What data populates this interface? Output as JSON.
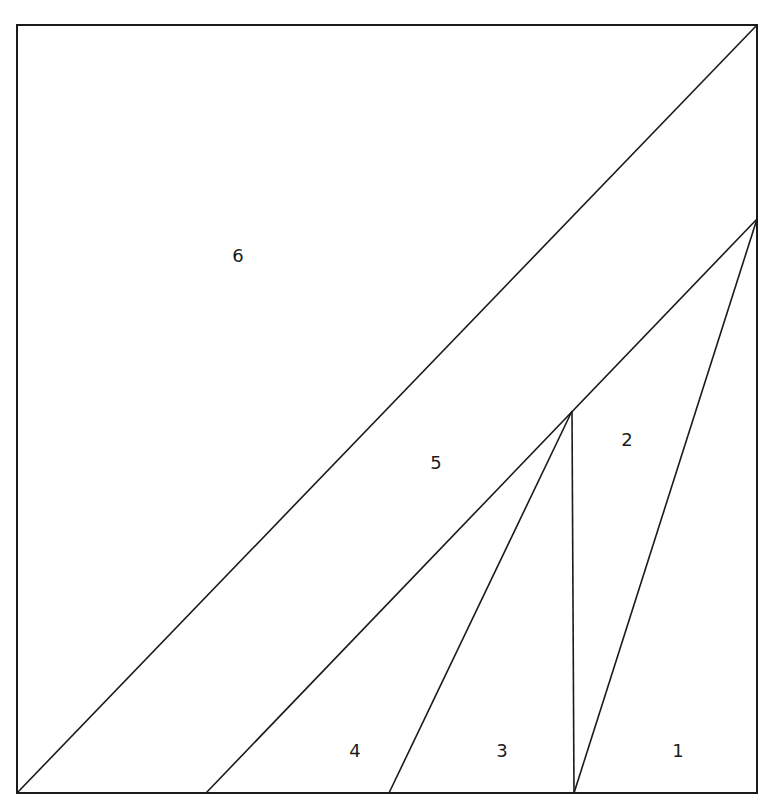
{
  "diagram": {
    "type": "square dissection into six regions",
    "stroke_color": "#1a1a1a",
    "background": "#ffffff",
    "square": {
      "x": 17,
      "y": 25,
      "width": 740,
      "height": 768
    },
    "points": {
      "top_right": [
        757,
        25
      ],
      "right_mid": [
        757,
        219
      ],
      "inner": [
        572,
        411
      ],
      "bottom_left": [
        17,
        793
      ],
      "bottom_a": [
        206,
        793
      ],
      "bottom_b": [
        389,
        793
      ],
      "bottom_c": [
        574,
        793
      ],
      "bottom_right": [
        757,
        793
      ]
    },
    "segments": [
      {
        "from": [
          17,
          793
        ],
        "to": [
          757,
          25
        ]
      },
      {
        "from": [
          206,
          793
        ],
        "to": [
          757,
          219
        ]
      },
      {
        "from": [
          389,
          793
        ],
        "to": [
          572,
          411
        ]
      },
      {
        "from": [
          574,
          793
        ],
        "to": [
          572,
          411
        ]
      },
      {
        "from": [
          574,
          793
        ],
        "to": [
          757,
          219
        ]
      }
    ],
    "regions": [
      {
        "label": "1",
        "x": 678,
        "y": 750
      },
      {
        "label": "2",
        "x": 627,
        "y": 445
      },
      {
        "label": "3",
        "x": 502,
        "y": 750
      },
      {
        "label": "4",
        "x": 355,
        "y": 750
      },
      {
        "label": "5",
        "x": 436,
        "y": 468
      },
      {
        "label": "6",
        "x": 238,
        "y": 262
      }
    ]
  }
}
